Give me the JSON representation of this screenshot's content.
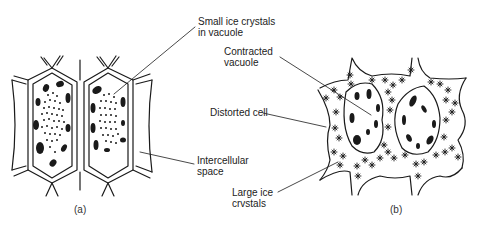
{
  "figure": {
    "panels": [
      {
        "id": "a",
        "caption": "(a)",
        "description": "Cells frozen slowly? no - cells with small ice crystals in vacuole"
      },
      {
        "id": "b",
        "caption": "(b)",
        "description": "Distorted cells with large ice crystals in intercellular space"
      }
    ],
    "labels": {
      "small_ice": {
        "line1": "Small ice crystals",
        "line2": "in vacuole"
      },
      "contracted": {
        "line1": "Contracted",
        "line2": "vacuole"
      },
      "distorted": {
        "line1": "Distorted cell"
      },
      "intercellular": {
        "line1": "Intercellular",
        "line2": "space"
      },
      "large_ice": {
        "line1": "Large ice",
        "line2": "crvstals"
      }
    },
    "colors": {
      "ink": "#1a1a1a",
      "background": "#ffffff"
    }
  }
}
